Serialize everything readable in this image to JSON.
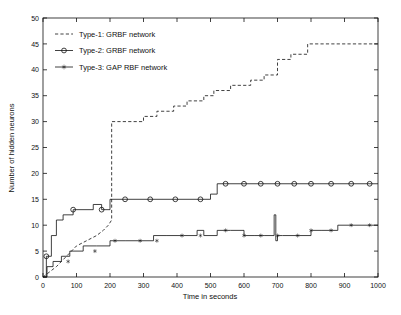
{
  "chart_data": {
    "type": "line",
    "title": "",
    "xlabel": "Time in seconds",
    "ylabel": "Number of hidden neurons",
    "xlim": [
      0,
      1000
    ],
    "ylim": [
      0,
      50
    ],
    "xticks": [
      0,
      100,
      200,
      300,
      400,
      500,
      600,
      700,
      800,
      900,
      1000
    ],
    "yticks": [
      0,
      5,
      10,
      15,
      20,
      25,
      30,
      35,
      40,
      45,
      50
    ],
    "grid": false,
    "legend_position": "upper-left-inside",
    "series": [
      {
        "name": "Type-1: GRBF network",
        "style": "dashed",
        "marker": "none",
        "legend_symbol": "---",
        "x": [
          0,
          20,
          40,
          55,
          70,
          100,
          130,
          160,
          180,
          195,
          205,
          205,
          300,
          300,
          340,
          340,
          390,
          390,
          430,
          430,
          480,
          480,
          510,
          510,
          560,
          560,
          620,
          620,
          660,
          660,
          700,
          700,
          740,
          740,
          790,
          790,
          1000
        ],
        "y": [
          0,
          1,
          2,
          3,
          4,
          6,
          7,
          8,
          9,
          10,
          11,
          30,
          30,
          31,
          31,
          32,
          32,
          33,
          33,
          34,
          34,
          35,
          35,
          36,
          36,
          37,
          37,
          38,
          38,
          39,
          39,
          42,
          42,
          43,
          43,
          45,
          45
        ]
      },
      {
        "name": "Type-2: GRBF network",
        "style": "solid",
        "marker": "o",
        "legend_symbol": "-o-",
        "x": [
          0,
          10,
          10,
          25,
          25,
          40,
          40,
          60,
          60,
          90,
          90,
          150,
          150,
          175,
          175,
          200,
          200,
          500,
          500,
          520,
          520,
          1000
        ],
        "y": [
          0,
          0,
          4,
          4,
          8,
          8,
          11,
          11,
          12,
          12,
          13,
          13,
          14,
          14,
          13,
          13,
          15,
          15,
          16,
          16,
          18,
          18
        ],
        "marker_x": [
          10,
          90,
          175,
          245,
          320,
          395,
          470,
          545,
          600,
          650,
          700,
          750,
          800,
          860,
          920,
          975
        ],
        "marker_y": [
          4,
          13,
          13,
          15,
          15,
          15,
          15,
          18,
          18,
          18,
          18,
          18,
          18,
          18,
          18,
          18
        ]
      },
      {
        "name": "Type-3: GAP RBF network",
        "style": "solid",
        "marker": "*",
        "legend_symbol": "-*-",
        "x": [
          0,
          12,
          12,
          30,
          30,
          55,
          55,
          80,
          80,
          120,
          120,
          160,
          160,
          200,
          200,
          245,
          245,
          290,
          290,
          330,
          330,
          370,
          370,
          420,
          420,
          460,
          460,
          480,
          480,
          520,
          520,
          560,
          560,
          600,
          600,
          630,
          630,
          660,
          660,
          690,
          690,
          695,
          695,
          700,
          700,
          715,
          715,
          760,
          760,
          800,
          800,
          830,
          830,
          880,
          880,
          1000
        ],
        "y": [
          0,
          0,
          2,
          2,
          3,
          3,
          4,
          4,
          5,
          5,
          6,
          6,
          6,
          6,
          7,
          7,
          7,
          7,
          7,
          7,
          8,
          8,
          8,
          8,
          8,
          8,
          9,
          9,
          8,
          8,
          9,
          9,
          9,
          9,
          8,
          8,
          8,
          8,
          8,
          8,
          12,
          12,
          7,
          7,
          8,
          8,
          8,
          8,
          8,
          8,
          9,
          9,
          9,
          9,
          10,
          10
        ],
        "marker_x": [
          75,
          155,
          215,
          290,
          340,
          415,
          470,
          545,
          600,
          650,
          700,
          760,
          800,
          860,
          920,
          975
        ],
        "marker_y": [
          3,
          5,
          7,
          7,
          7,
          8,
          8,
          9,
          8,
          8,
          8,
          8,
          9,
          9,
          10,
          10
        ]
      }
    ]
  },
  "legend": {
    "entries": [
      {
        "symbol": "---",
        "label": "Type-1: GRBF network"
      },
      {
        "symbol": "-o-",
        "label": "Type-2: GRBF network"
      },
      {
        "symbol": "-*-",
        "label": "Type-3: GAP RBF network"
      }
    ]
  },
  "axes": {
    "x_title": "Time in seconds",
    "y_title": "Number of hidden neurons",
    "x_tick_labels": [
      "0",
      "100",
      "200",
      "300",
      "400",
      "500",
      "600",
      "700",
      "800",
      "900",
      "1000"
    ],
    "y_tick_labels": [
      "0",
      "5",
      "10",
      "15",
      "20",
      "25",
      "30",
      "35",
      "40",
      "45",
      "50"
    ]
  },
  "colors": {
    "ink": "#111111",
    "background": "#ffffff"
  }
}
